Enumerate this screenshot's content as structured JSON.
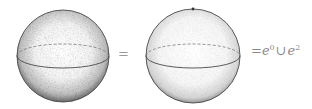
{
  "diagram": {
    "left_sphere": {
      "label": "sphere",
      "cx": 63,
      "cy": 56,
      "r": 46,
      "shading": "dense stippling"
    },
    "equals_1": "=",
    "right_sphere": {
      "label": "sphere with point",
      "cx": 193,
      "cy": 56,
      "r": 47,
      "point": [
        193,
        9
      ],
      "shading": "light stippling"
    },
    "equals_2": "=",
    "formula": {
      "base1": "e",
      "exp1": "0",
      "union": "∪",
      "base2": "e",
      "exp2": "2"
    },
    "colors": {
      "stroke": "#4a4a4a",
      "dashed": "#7a7a7a",
      "text": "#8a8a8a",
      "background": "#ffffff"
    }
  }
}
